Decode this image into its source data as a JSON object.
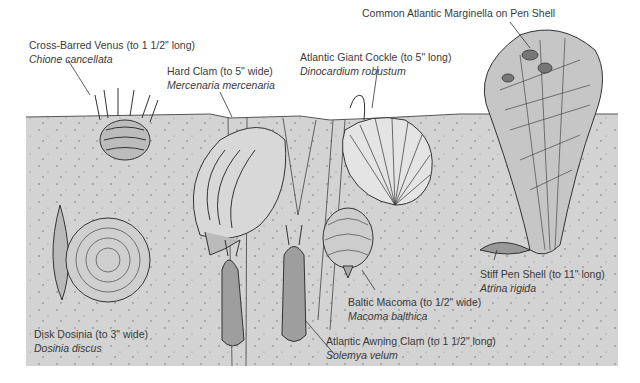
{
  "illustration": {
    "subject": "Burrowing bivalves in sandy sediment cross-section",
    "colors": {
      "sediment": "#d3d3d3",
      "background": "#ffffff",
      "ink": "#333333"
    }
  },
  "labels": [
    {
      "id": "cross-barred-venus",
      "common": "Cross-Barred Venus (to 1 1/2\" long)",
      "scientific": "Chione cancellata"
    },
    {
      "id": "hard-clam",
      "common": "Hard Clam (to 5\" wide)",
      "scientific": "Mercenaria mercenaria"
    },
    {
      "id": "atlantic-giant-cockle",
      "common": "Atlantic Giant Cockle (to 5\" long)",
      "scientific": "Dinocardium robustum"
    },
    {
      "id": "common-atlantic-marginella",
      "common": "Common Atlantic Marginella on Pen Shell",
      "scientific": ""
    },
    {
      "id": "disk-dosinia",
      "common": "Disk Dosinia (to 3\" wide)",
      "scientific": "Dosinia discus"
    },
    {
      "id": "baltic-macoma",
      "common": "Baltic Macoma (to 1/2\" wide)",
      "scientific": "Macoma balthica"
    },
    {
      "id": "atlantic-awning-clam",
      "common": "Atlantic Awning Clam (to 1 1/2\" long)",
      "scientific": "Solemya velum"
    },
    {
      "id": "stiff-pen-shell",
      "common": "Stiff Pen Shell (to 11\" long)",
      "scientific": "Atrina rigida"
    }
  ]
}
